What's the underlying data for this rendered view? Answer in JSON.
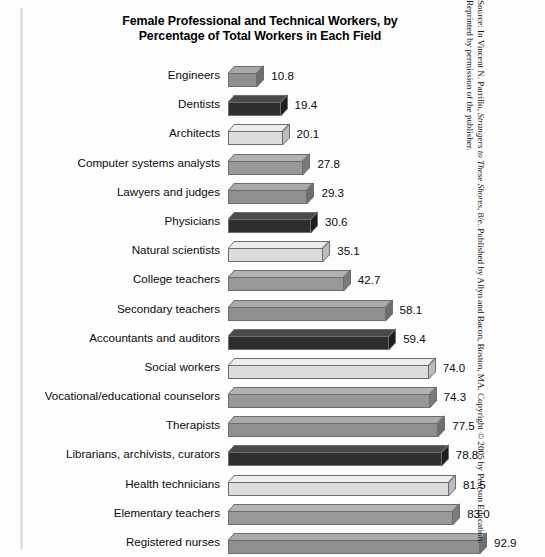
{
  "chart_data": {
    "type": "bar",
    "orientation": "horizontal",
    "title": "Female Professional and Technical Workers, by Percentage of Total Workers in Each Field",
    "title_line1": "Female Professional and Technical Workers, by",
    "title_line2": "Percentage of Total Workers in Each Field",
    "xlabel": "",
    "ylabel": "",
    "xlim": [
      0,
      92.9
    ],
    "grid": false,
    "legend": "none",
    "value_label_format": "one decimal",
    "categories": [
      "Engineers",
      "Dentists",
      "Architects",
      "Computer systems analysts",
      "Lawyers and judges",
      "Physicians",
      "Natural scientists",
      "College teachers",
      "Secondary teachers",
      "Accountants and auditors",
      "Social workers",
      "Vocational/educational counselors",
      "Therapists",
      "Librarians, archivists, curators",
      "Health technicians",
      "Elementary teachers",
      "Registered nurses"
    ],
    "values": [
      10.8,
      19.4,
      20.1,
      27.8,
      29.3,
      30.6,
      35.1,
      42.7,
      58.1,
      59.4,
      74.0,
      74.3,
      77.5,
      78.8,
      81.5,
      83.0,
      92.9
    ],
    "value_labels": [
      "10.8",
      "19.4",
      "20.1",
      "27.8",
      "29.3",
      "30.6",
      "35.1",
      "42.7",
      "58.1",
      "59.4",
      "74.0",
      "74.3",
      "77.5",
      "78.8",
      "81.5",
      "83.0",
      "92.9"
    ],
    "bar_colors": [
      "#8f8f8f",
      "#2e2e2e",
      "#dcdcdc",
      "#989898",
      "#8f8f8f",
      "#2e2e2e",
      "#dcdcdc",
      "#989898",
      "#8f8f8f",
      "#2e2e2e",
      "#dcdcdc",
      "#989898",
      "#8f8f8f",
      "#2e2e2e",
      "#dcdcdc",
      "#989898",
      "#8f8f8f"
    ],
    "bar_top_colors": [
      "#a9a9a9",
      "#4a4a4a",
      "#ededed",
      "#b2b2b2",
      "#a9a9a9",
      "#4a4a4a",
      "#ededed",
      "#b2b2b2",
      "#a9a9a9",
      "#4a4a4a",
      "#ededed",
      "#b2b2b2",
      "#a9a9a9",
      "#4a4a4a",
      "#ededed",
      "#b2b2b2",
      "#a9a9a9"
    ],
    "bar_side_colors": [
      "#6f6f6f",
      "#1d1d1d",
      "#bdbdbd",
      "#7b7b7b",
      "#6f6f6f",
      "#1d1d1d",
      "#bdbdbd",
      "#7b7b7b",
      "#6f6f6f",
      "#1d1d1d",
      "#bdbdbd",
      "#7b7b7b",
      "#6f6f6f",
      "#1d1d1d",
      "#bdbdbd",
      "#7b7b7b",
      "#6f6f6f"
    ]
  },
  "source": {
    "line1_prefix": "Source: In Vincent N. Parrillo, ",
    "line1_italic": "Strangers to These Shores",
    "line1_suffix": ", 8/e. Published by Allyn and Bacon, Boston, MA. Copyright",
    "line2": "© 2005 by Pearson Education. Reprinted by permission of the publisher."
  }
}
